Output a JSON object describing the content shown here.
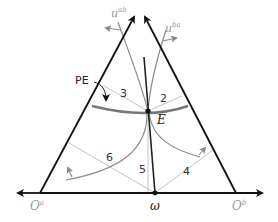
{
  "diagram": {
    "type": "edgeworth-triangle",
    "colors": {
      "axis": "#111111",
      "contract_curve": "#777777",
      "indifference_curve": "#8a8a8a",
      "region_line": "#c4c4c4",
      "label_gray": "#9a9a9a"
    },
    "labels": {
      "u_b": "u",
      "u_b_sup": "ab",
      "u_a": "u",
      "u_a_sup": "ba",
      "pe": "PE",
      "e": "E",
      "omega": "ω",
      "o_a": "O",
      "o_a_sup": "a",
      "o_b": "O",
      "o_b_sup": "b"
    },
    "regions": [
      {
        "id": "2",
        "label": "2"
      },
      {
        "id": "3",
        "label": "3"
      },
      {
        "id": "4",
        "label": "4"
      },
      {
        "id": "5",
        "label": "5"
      },
      {
        "id": "6",
        "label": "6"
      }
    ]
  }
}
